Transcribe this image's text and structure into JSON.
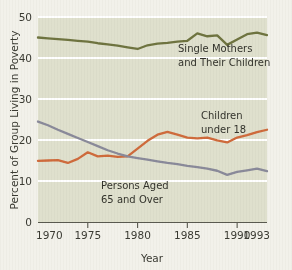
{
  "chart_data": {
    "type": "line",
    "title": "",
    "xlabel": "Year",
    "ylabel": "Percent of Group Living in Poverty",
    "xlim": [
      1970,
      1993
    ],
    "ylim": [
      0,
      50
    ],
    "grid": "horizontal-white",
    "legend_position": "inline-annotations",
    "plot_background": "#dfe0cd",
    "figure_background": "#f2f1ea",
    "yticks": [
      0,
      10,
      20,
      30,
      40,
      50
    ],
    "ytick_labels": [
      "0",
      "10",
      "20",
      "30",
      "40",
      "50"
    ],
    "xticks": [
      1970,
      1975,
      1980,
      1985,
      1990,
      1993
    ],
    "xtick_labels": [
      "1970",
      "1975",
      "1980",
      "1985",
      "1990",
      "1993"
    ],
    "x": [
      1970,
      1971,
      1972,
      1973,
      1974,
      1975,
      1976,
      1977,
      1978,
      1979,
      1980,
      1981,
      1982,
      1983,
      1984,
      1985,
      1986,
      1987,
      1988,
      1989,
      1990,
      1991,
      1992,
      1993
    ],
    "series": [
      {
        "name": "Single Mothers and Their Children",
        "color": "#6f7440",
        "label_line1": "Single Mothers",
        "label_line2": "and Their Children",
        "values": [
          45.0,
          44.8,
          44.6,
          44.4,
          44.2,
          44.0,
          43.6,
          43.3,
          43.0,
          42.6,
          42.2,
          43.1,
          43.5,
          43.7,
          44.0,
          44.2,
          46.0,
          45.3,
          45.5,
          43.2,
          44.5,
          45.8,
          46.2,
          45.6
        ]
      },
      {
        "name": "Children under 18",
        "color": "#cf6b3c",
        "label_line1": "Children",
        "label_line2": "under 18",
        "values": [
          14.9,
          15.0,
          15.1,
          14.4,
          15.4,
          17.0,
          16.0,
          16.2,
          15.9,
          16.0,
          17.9,
          19.8,
          21.3,
          22.0,
          21.3,
          20.6,
          20.4,
          20.6,
          19.9,
          19.4,
          20.6,
          21.2,
          21.9,
          22.5
        ]
      },
      {
        "name": "Persons Aged 65 and Over",
        "color": "#8a8a9a",
        "label_line1": "Persons Aged",
        "label_line2": "65 and Over",
        "values": [
          24.5,
          23.6,
          22.5,
          21.5,
          20.5,
          19.5,
          18.5,
          17.5,
          16.7,
          16.0,
          15.6,
          15.2,
          14.8,
          14.4,
          14.1,
          13.7,
          13.4,
          13.0,
          12.5,
          11.5,
          12.2,
          12.6,
          13.0,
          12.4
        ]
      }
    ]
  }
}
